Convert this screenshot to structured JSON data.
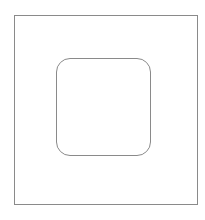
{
  "diagram": {
    "background": "#ffffff",
    "outer_frame": {
      "shape": "rectangle",
      "x": 14,
      "y": 15,
      "width": 184,
      "height": 190,
      "border_color": "#8a8a8a",
      "border_width": 1,
      "corner_radius": 0
    },
    "inner_square": {
      "shape": "rounded-rectangle",
      "x": 56,
      "y": 58,
      "width": 95,
      "height": 98,
      "border_color": "#8a8a8a",
      "border_width": 1,
      "corner_radius": 14
    }
  }
}
